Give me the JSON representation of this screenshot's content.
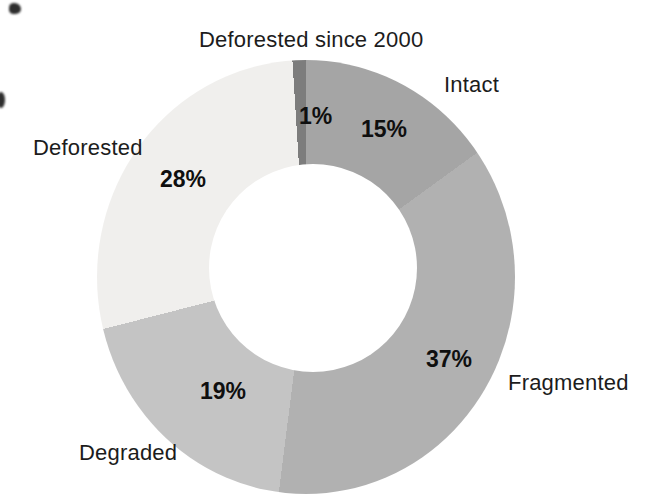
{
  "chart_data": {
    "type": "pie",
    "variant": "donut",
    "direction": "clockwise",
    "start_angle": "top",
    "hole_ratio": 0.49,
    "background": "#ffffff",
    "text_color": "#1c1c1c",
    "segments": [
      {
        "label": "Intact",
        "value": 15,
        "pct_label": "15%",
        "color": "#a5a5a5"
      },
      {
        "label": "Fragmented",
        "value": 37,
        "pct_label": "37%",
        "color": "#b1b1b1"
      },
      {
        "label": "Degraded",
        "value": 19,
        "pct_label": "19%",
        "color": "#c4c4c4"
      },
      {
        "label": "Deforested",
        "value": 28,
        "pct_label": "28%",
        "color": "#f0efed"
      },
      {
        "label": "Deforested since 2000",
        "value": 1,
        "pct_label": "1%",
        "color": "#7d7d7d"
      }
    ]
  }
}
